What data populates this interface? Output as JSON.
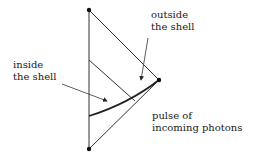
{
  "diagram": {
    "type": "spacetime-diagram",
    "labels": {
      "outside": [
        "outside",
        "the shell"
      ],
      "inside": [
        "inside",
        "the shell"
      ],
      "pulse": [
        "pulse of",
        "incoming photons"
      ]
    },
    "points": {
      "top": [
        89,
        10
      ],
      "right": [
        159,
        80
      ],
      "bottom": [
        89,
        149
      ]
    },
    "colors": {
      "line": "#222222",
      "text": "#1a1a1a",
      "background": "#ffffff"
    }
  }
}
